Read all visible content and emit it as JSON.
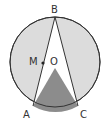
{
  "diagram": {
    "type": "circle-geometry",
    "colors": {
      "background": "#ffffff",
      "circle_fill": "#dcdcdc",
      "triangle_fill": "#ffffff",
      "shaded_fill": "#8c8c8c",
      "stroke": "#333333"
    },
    "circle": {
      "cx": 55,
      "cy": 62,
      "r": 45
    },
    "points": {
      "B": {
        "label": "B",
        "x": 55,
        "y": 18
      },
      "A": {
        "label": "A",
        "x": 33,
        "y": 106
      },
      "C": {
        "label": "C",
        "x": 78,
        "y": 106
      },
      "O": {
        "label": "O",
        "x": 55,
        "y": 68
      },
      "M": {
        "label": "M",
        "x": 43,
        "y": 63
      }
    },
    "labels": {
      "B": "B",
      "A": "A",
      "C": "C",
      "O": "O",
      "M": "M"
    }
  }
}
